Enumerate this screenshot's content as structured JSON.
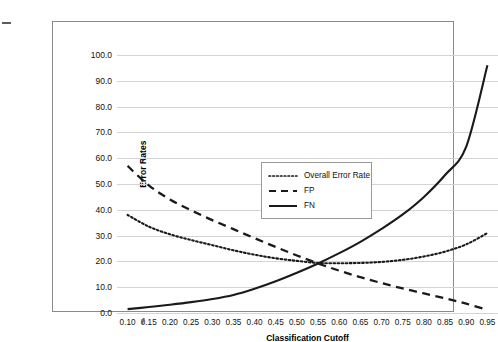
{
  "chart_data": {
    "type": "line",
    "title": "",
    "xlabel": "Classification Cutoff",
    "ylabel": "Error Rates",
    "xlim": [
      0.075,
      0.975
    ],
    "ylim": [
      0,
      100
    ],
    "grid": true,
    "legend_position": "center",
    "x": [
      0.1,
      0.15,
      0.2,
      0.25,
      0.3,
      0.35,
      0.4,
      0.45,
      0.5,
      0.55,
      0.6,
      0.65,
      0.7,
      0.75,
      0.8,
      0.85,
      0.9,
      0.95
    ],
    "xticklabels": [
      "0.10",
      "0.15",
      "0.20",
      "0.25",
      "0.30",
      "0.35",
      "0.40",
      "0.45",
      "0.50",
      "0.55",
      "0.60",
      "0.65",
      "0.70",
      "0.75",
      "0.80",
      "0.85",
      "0.90",
      "0.95"
    ],
    "yticks": [
      0,
      10,
      20,
      30,
      40,
      50,
      60,
      70,
      80,
      90,
      100
    ],
    "yticklabels": [
      "0.0",
      "10.0",
      "20.0",
      "30.0",
      "40.0",
      "50.0",
      "60.0",
      "70.0",
      "80.0",
      "90.0",
      "100.0"
    ],
    "series": [
      {
        "name": "Overall Error Rate",
        "style": "dotted",
        "color": "#1a1a1a",
        "values": [
          38.0,
          33.5,
          30.5,
          28.3,
          26.3,
          24.3,
          22.6,
          21.2,
          20.2,
          19.4,
          19.3,
          19.4,
          19.8,
          20.6,
          21.9,
          23.8,
          26.6,
          31.0
        ]
      },
      {
        "name": "FP",
        "style": "dashed",
        "color": "#1a1a1a",
        "values": [
          57.0,
          49.5,
          44.0,
          39.8,
          36.0,
          32.5,
          29.0,
          25.6,
          22.3,
          19.2,
          16.4,
          13.9,
          11.6,
          9.5,
          7.6,
          5.7,
          3.6,
          1.2
        ]
      },
      {
        "name": "FN",
        "style": "solid",
        "color": "#1a1a1a",
        "values": [
          1.5,
          2.3,
          3.2,
          4.2,
          5.4,
          7.0,
          9.4,
          12.3,
          15.6,
          19.2,
          23.2,
          27.6,
          32.6,
          38.2,
          45.0,
          53.5,
          64.5,
          96.0
        ]
      }
    ]
  },
  "legend": {
    "items": [
      {
        "label": "Overall Error Rate"
      },
      {
        "label": "FP"
      },
      {
        "label": "FN"
      }
    ]
  }
}
